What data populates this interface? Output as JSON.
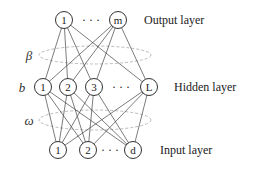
{
  "diagram": {
    "type": "neural-network",
    "layers": {
      "output": {
        "label": "Output layer",
        "nodes": [
          "1",
          "m"
        ],
        "ellipsis": "· · ·"
      },
      "hidden": {
        "label": "Hidden layer",
        "nodes": [
          "1",
          "2",
          "3",
          "L"
        ],
        "ellipsis": "· · ·",
        "bias_symbol": "b"
      },
      "input": {
        "label": "Input layer",
        "nodes": [
          "1",
          "2",
          "d"
        ],
        "ellipsis": "· · ·"
      }
    },
    "weights": {
      "hidden_to_output": "β",
      "input_to_hidden": "ω"
    }
  }
}
